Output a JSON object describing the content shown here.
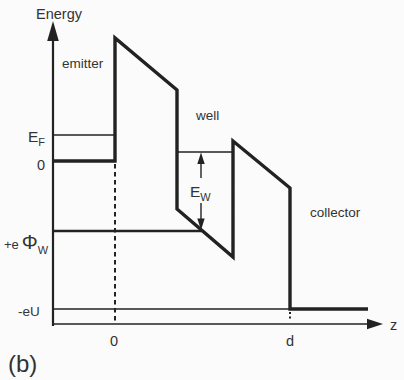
{
  "figure": {
    "panel_label": "(b)",
    "axes": {
      "y_label": "Energy",
      "x_label": "z",
      "x_ticks": [
        {
          "label": "0"
        },
        {
          "label": "d"
        }
      ]
    },
    "regions": [
      {
        "label": "emitter"
      },
      {
        "label": "well"
      },
      {
        "label": "collector"
      }
    ],
    "energy_levels": {
      "fermi": {
        "main": "E",
        "sub": "F"
      },
      "zero": "0",
      "well_depth": {
        "main": "E",
        "sub": "W"
      },
      "phi": {
        "prefix": "+e",
        "main": "Φ",
        "sub": "W"
      },
      "bias": "-eU"
    }
  },
  "colors": {
    "line": "#222222",
    "text": "#333333",
    "background": "#fbfbfb"
  },
  "geometry": {
    "band_profile": "53,161 115,161 115,38 177,90 177,209 233,257 233,141 290,188 290,309 368,309",
    "fermi_line": "53,135 115,135",
    "well_top_line": "177,152 233,152",
    "phi_line": "53,231 202,231",
    "bias_line": "53,309 290,309",
    "energy_axis": "53,326 53,36",
    "energy_axis_arrow": "53,21 47.2,41 58.8,41",
    "z_axis": "53,324 371,324",
    "z_axis_arrow": "383,324 367,318.8 367,329.2",
    "origin_dashed_line": "115,164 115,322",
    "d_dotted_line": "290,312 290,321",
    "ew_arrow_top_shaft": "201,156 201,178",
    "ew_arrow_top_head": "201,152.5 197.3,164 204.7,164",
    "ew_arrow_bottom_shaft": "201,203 201,226",
    "ew_arrow_bottom_head": "201,230 197.3,218.5 204.7,218.5"
  }
}
